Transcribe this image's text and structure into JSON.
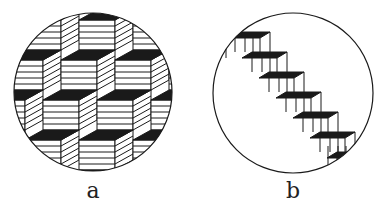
{
  "figure": {
    "panels": [
      {
        "label": "a",
        "description": "ambiguous stacked cubes pattern in circle",
        "circle": {
          "cx": 93,
          "cy": 92,
          "r": 79
        }
      },
      {
        "label": "b",
        "description": "ambiguous staircase (Schröder stairs) in circle",
        "circle": {
          "cx": 293,
          "cy": 93,
          "r": 80
        }
      }
    ],
    "colors": {
      "ink": "#1a1a1a",
      "paper": "#ffffff"
    }
  }
}
